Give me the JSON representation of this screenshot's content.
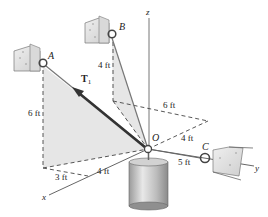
{
  "figure": {
    "labels": {
      "point_A": "A",
      "point_B": "B",
      "point_C": "C",
      "point_O": "O",
      "axis_x": "x",
      "axis_y": "y",
      "axis_z": "z",
      "force_T": "T",
      "force_T_sub": "1"
    },
    "dimensions": {
      "a_height": "6 ft",
      "b_height": "4 ft",
      "b_to_yline": "6 ft",
      "o_to_yline": "4 ft",
      "x_3ft": "3 ft",
      "x_4ft": "4 ft",
      "oc_length": "5 ft"
    },
    "colors": {
      "shade": "#e6e6e6",
      "line": "#555555",
      "force": "#333333",
      "dash": "#444444"
    }
  }
}
